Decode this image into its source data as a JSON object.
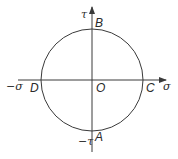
{
  "diagram": {
    "type": "mohr-circle",
    "colors": {
      "line": "#3a3a3a",
      "text": "#2a2a2a",
      "background": "#ffffff"
    },
    "axes": {
      "horizontal": {
        "positive_label": "σ",
        "negative_label": "−σ"
      },
      "vertical": {
        "positive_label": "τ",
        "negative_label": "−τ"
      }
    },
    "origin_label": "O",
    "points": [
      {
        "id": "A",
        "label": "A",
        "position": "bottom of circle on τ-axis"
      },
      {
        "id": "B",
        "label": "B",
        "position": "top of circle on τ-axis"
      },
      {
        "id": "C",
        "label": "C",
        "position": "right of circle on σ-axis"
      },
      {
        "id": "D",
        "label": "D",
        "position": "left of circle on σ-axis"
      }
    ]
  }
}
